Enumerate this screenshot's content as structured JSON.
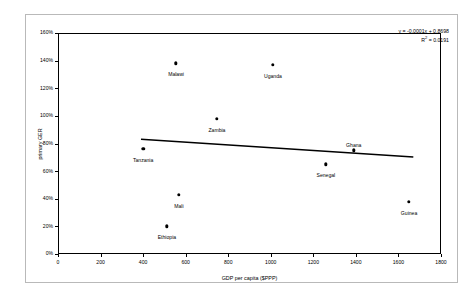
{
  "chart_data": {
    "type": "scatter",
    "title": "",
    "xlabel": "GDP per capita ($PPP)",
    "ylabel": "primary GER",
    "xlim": [
      0,
      1800
    ],
    "ylim": [
      0,
      1.6
    ],
    "grid": false,
    "legend": false,
    "xticks": [
      "0",
      "200",
      "400",
      "600",
      "800",
      "1000",
      "1200",
      "1400",
      "1600",
      "1800"
    ],
    "xtick_values": [
      0,
      200,
      400,
      600,
      800,
      1000,
      1200,
      1400,
      1600,
      1800
    ],
    "yticks": [
      "0%",
      "20%",
      "40%",
      "60%",
      "80%",
      "100%",
      "120%",
      "140%",
      "160%"
    ],
    "ytick_values": [
      0,
      0.2,
      0.4,
      0.6,
      0.8,
      1.0,
      1.2,
      1.4,
      1.6
    ],
    "points": [
      {
        "label": "Tanzania",
        "x": 400,
        "y": 0.76,
        "label_dx": 0,
        "label_dy": 9
      },
      {
        "label": "Ethiopia",
        "x": 512,
        "y": 0.2,
        "label_dx": 0,
        "label_dy": 9
      },
      {
        "label": "Mali",
        "x": 568,
        "y": 0.43,
        "label_dx": 0,
        "label_dy": 9
      },
      {
        "label": "Malawi",
        "x": 555,
        "y": 1.38,
        "label_dx": 0,
        "label_dy": 9
      },
      {
        "label": "Zambia",
        "x": 747,
        "y": 0.98,
        "label_dx": 0,
        "label_dy": 9
      },
      {
        "label": "Uganda",
        "x": 1010,
        "y": 1.37,
        "label_dx": 0,
        "label_dy": 9
      },
      {
        "label": "Senegal",
        "x": 1259,
        "y": 0.65,
        "label_dx": 0,
        "label_dy": 9
      },
      {
        "label": "Ghana",
        "x": 1390,
        "y": 0.75,
        "label_dx": 0,
        "label_dy": -7
      },
      {
        "label": "Guinea",
        "x": 1650,
        "y": 0.38,
        "label_dx": 0,
        "label_dy": 9
      }
    ],
    "trendline": {
      "slope": -0.0001,
      "intercept": 0.8698,
      "x_start": 390,
      "x_end": 1670,
      "equation": "y = -0.0001x + 0.8698",
      "r_squared_label": "R",
      "r_squared_exponent": "2",
      "r_squared_value": " = 0.0191"
    }
  }
}
